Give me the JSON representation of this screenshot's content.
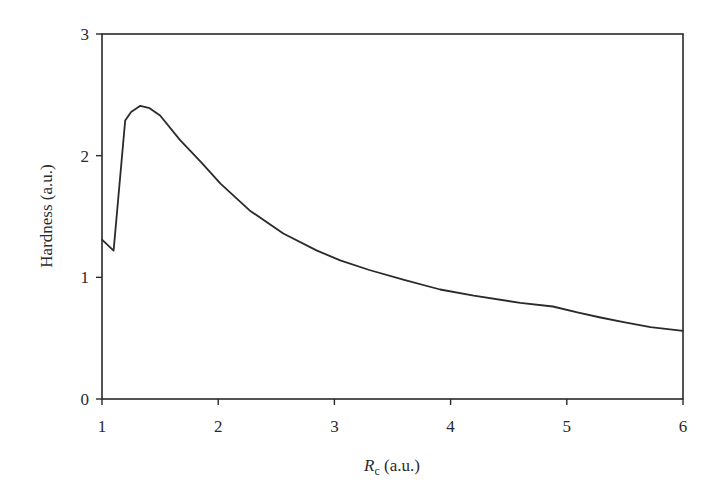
{
  "chart_data": {
    "type": "line",
    "title": "",
    "xlabel": "R_c (a.u.)",
    "xlabel_parts": {
      "main": "R",
      "sub": "c",
      "rest": " (a.u.)"
    },
    "ylabel": "Hardness (a.u.)",
    "xlim": [
      1,
      6
    ],
    "ylim": [
      0,
      3
    ],
    "xticks": [
      1,
      2,
      3,
      4,
      5,
      6
    ],
    "yticks": [
      0,
      1,
      2,
      3
    ],
    "grid": false,
    "legend": null,
    "frame": "box",
    "series": [
      {
        "name": "Hardness",
        "color": "#2a2a2a",
        "x": [
          1.0,
          1.1,
          1.2,
          1.25,
          1.33,
          1.41,
          1.5,
          1.67,
          1.85,
          2.02,
          2.27,
          2.56,
          2.85,
          3.05,
          3.3,
          3.6,
          3.91,
          4.2,
          4.6,
          4.88,
          5.1,
          5.29,
          5.5,
          5.72,
          6.0
        ],
        "y": [
          1.31,
          1.22,
          2.29,
          2.36,
          2.41,
          2.39,
          2.33,
          2.13,
          1.95,
          1.77,
          1.55,
          1.36,
          1.22,
          1.14,
          1.06,
          0.98,
          0.9,
          0.85,
          0.79,
          0.76,
          0.71,
          0.67,
          0.63,
          0.59,
          0.56
        ]
      }
    ]
  },
  "layout": {
    "plot_left": 102,
    "plot_right": 683,
    "plot_top": 34,
    "plot_bottom": 399
  }
}
